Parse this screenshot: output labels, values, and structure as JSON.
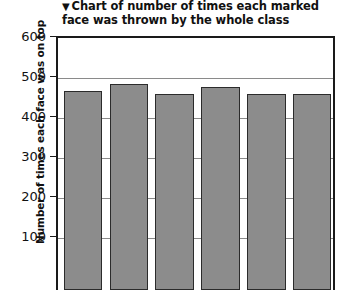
{
  "chart_data": {
    "type": "bar",
    "title": "Chart of number of times each marked face was thrown by the whole class",
    "title_marker_icon": "triangle-down-icon",
    "title_line_1": "▼ Chart of number of times each marked",
    "title_line_2": "face was thrown by the whole class",
    "xlabel": "",
    "ylabel": "Number of times each face was on top",
    "categories": [
      "1",
      "2",
      "3",
      "4",
      "5",
      "6"
    ],
    "values": [
      497,
      516,
      490,
      508,
      491,
      490
    ],
    "ylim": [
      0,
      600
    ],
    "ytick_labels": [
      "600",
      "500",
      "400",
      "300",
      "200",
      "100"
    ],
    "ytick_values": [
      600,
      500,
      400,
      300,
      200,
      100
    ],
    "grid": true,
    "grid_axis": "y",
    "legend": false,
    "bar_fill_color": "#8c8c8c",
    "bar_edge_color": "#2b2b2b",
    "axis_color": "#1a1a1a",
    "gridline_color": "#8a8a8a",
    "background_color": "#ffffff",
    "note": "x-axis labels are cropped out of the visible screenshot"
  }
}
